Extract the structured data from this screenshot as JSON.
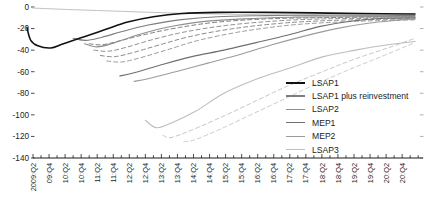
{
  "chart_data": {
    "type": "line",
    "title": "",
    "xlabel": "",
    "ylabel": "",
    "x_axis": {
      "start_label": "2009:Q2",
      "end_label": "20:Q4",
      "tick_unit": "quarter",
      "label_rotation_deg": -90,
      "tick_labels": [
        "2009:Q2",
        "09:Q4",
        "10:Q2",
        "10:Q4",
        "11:Q2",
        "11:Q4",
        "12:Q2",
        "12:Q4",
        "13:Q2",
        "13:Q4",
        "14:Q2",
        "14:Q4",
        "15:Q2",
        "15:Q4",
        "16:Q2",
        "16:Q4",
        "17:Q2",
        "17:Q4",
        "18:Q2",
        "18:Q4",
        "19:Q2",
        "19:Q4",
        "20:Q2",
        "20:Q4"
      ]
    },
    "y_axis": {
      "ticks": [
        0,
        -20,
        -40,
        -60,
        -80,
        -100,
        -120,
        -140
      ],
      "tick_labels": [
        "0",
        "-20",
        "-40",
        "-60",
        "-80",
        "-100",
        "-120",
        "-140"
      ],
      "range": [
        -140,
        0
      ],
      "right_edge_ticks": true
    },
    "grid": "off",
    "legend_position": "inside-right",
    "series": [
      {
        "name": "LSAP1",
        "color": "#111111",
        "width": 1.6,
        "dash": null,
        "in_legend": true,
        "points": [
          [
            2009.06,
            -19
          ],
          [
            2009.18,
            -31
          ],
          [
            2009.4,
            -36
          ],
          [
            2009.8,
            -38
          ],
          [
            2010.2,
            -34
          ],
          [
            2010.8,
            -28
          ],
          [
            2011.5,
            -21
          ],
          [
            2012.2,
            -14
          ],
          [
            2013.0,
            -9
          ],
          [
            2013.9,
            -6
          ],
          [
            2015.0,
            -5
          ],
          [
            2016.5,
            -5
          ],
          [
            2018.0,
            -5.5
          ],
          [
            2019.5,
            -6
          ],
          [
            2021.15,
            -6.5
          ]
        ]
      },
      {
        "name": "LSAP1 plus reinvestment",
        "color": "#7d7d7d",
        "width": 1.1,
        "dash": null,
        "in_legend": true,
        "points": [
          [
            2010.5,
            -29
          ],
          [
            2010.9,
            -31
          ],
          [
            2011.4,
            -28
          ],
          [
            2012.0,
            -23
          ],
          [
            2012.8,
            -17
          ],
          [
            2013.8,
            -12
          ],
          [
            2015.0,
            -9
          ],
          [
            2016.5,
            -8
          ],
          [
            2018.0,
            -7.5
          ],
          [
            2019.5,
            -7.5
          ],
          [
            2021.15,
            -8
          ]
        ]
      },
      {
        "name": "LSAP2",
        "color": "#8f8f8f",
        "width": 1.1,
        "dash": null,
        "in_legend": true,
        "points": [
          [
            2010.85,
            -34
          ],
          [
            2011.25,
            -37
          ],
          [
            2011.8,
            -33
          ],
          [
            2012.5,
            -26
          ],
          [
            2013.4,
            -19
          ],
          [
            2014.4,
            -14
          ],
          [
            2015.8,
            -11
          ],
          [
            2017.3,
            -9.5
          ],
          [
            2019.0,
            -9
          ],
          [
            2021.15,
            -9
          ]
        ]
      },
      {
        "name": "MEP1",
        "color": "#6f6f6f",
        "width": 1.1,
        "dash": null,
        "in_legend": true,
        "points": [
          [
            2011.95,
            -64
          ],
          [
            2012.4,
            -61
          ],
          [
            2013.2,
            -54
          ],
          [
            2014.2,
            -46
          ],
          [
            2015.2,
            -40
          ],
          [
            2016.2,
            -33
          ],
          [
            2017.2,
            -26
          ],
          [
            2018.2,
            -18
          ],
          [
            2019.2,
            -13
          ],
          [
            2020.2,
            -10.5
          ],
          [
            2021.15,
            -10
          ]
        ]
      },
      {
        "name": "MEP2",
        "color": "#9b9b9b",
        "width": 1.1,
        "dash": null,
        "in_legend": true,
        "points": [
          [
            2012.4,
            -69
          ],
          [
            2012.9,
            -66
          ],
          [
            2013.7,
            -60
          ],
          [
            2014.7,
            -52
          ],
          [
            2015.7,
            -44
          ],
          [
            2016.7,
            -35
          ],
          [
            2017.7,
            -27
          ],
          [
            2018.7,
            -20
          ],
          [
            2019.7,
            -15
          ],
          [
            2020.7,
            -12
          ],
          [
            2021.15,
            -11
          ]
        ]
      },
      {
        "name": "LSAP3",
        "color": "#bdbdbd",
        "width": 1.1,
        "dash": null,
        "in_legend": true,
        "points": [
          [
            2012.75,
            -105
          ],
          [
            2013.1,
            -112
          ],
          [
            2013.6,
            -107
          ],
          [
            2014.3,
            -97
          ],
          [
            2015.2,
            -80
          ],
          [
            2016.2,
            -67
          ],
          [
            2017.2,
            -57
          ],
          [
            2018.3,
            -46
          ],
          [
            2019.3,
            -40
          ],
          [
            2020.3,
            -35
          ],
          [
            2021.15,
            -32
          ]
        ]
      },
      {
        "name": "LSAP1 plus reinvestment (dashed variant)",
        "color": "#7d7d7d",
        "width": 1,
        "dash": "4,3",
        "in_legend": false,
        "points": [
          [
            2011.0,
            -34
          ],
          [
            2011.4,
            -35
          ],
          [
            2012.0,
            -31
          ],
          [
            2012.8,
            -25
          ],
          [
            2013.8,
            -19
          ],
          [
            2015.0,
            -14
          ],
          [
            2016.5,
            -11
          ],
          [
            2018.0,
            -10
          ],
          [
            2019.5,
            -9.5
          ],
          [
            2021.15,
            -9
          ]
        ]
      },
      {
        "name": "LSAP2 (dashed variant)",
        "color": "#8f8f8f",
        "width": 1,
        "dash": "4,3",
        "in_legend": false,
        "points": [
          [
            2011.15,
            -40
          ],
          [
            2011.6,
            -41
          ],
          [
            2012.2,
            -37
          ],
          [
            2013.0,
            -30
          ],
          [
            2014.0,
            -23
          ],
          [
            2015.3,
            -17
          ],
          [
            2016.8,
            -13
          ],
          [
            2018.3,
            -11
          ],
          [
            2019.8,
            -10.5
          ],
          [
            2021.15,
            -10
          ]
        ]
      },
      {
        "name": "MEP1 (dashed variant)",
        "color": "#8a8a8a",
        "width": 1,
        "dash": "4,3",
        "in_legend": false,
        "points": [
          [
            2011.35,
            -45
          ],
          [
            2011.8,
            -46
          ],
          [
            2012.4,
            -42
          ],
          [
            2013.2,
            -35
          ],
          [
            2014.2,
            -27
          ],
          [
            2015.5,
            -20
          ],
          [
            2017.0,
            -15
          ],
          [
            2018.5,
            -12.5
          ],
          [
            2020.0,
            -11.5
          ],
          [
            2021.15,
            -11
          ]
        ]
      },
      {
        "name": "MEP2 (dashed variant)",
        "color": "#9b9b9b",
        "width": 1,
        "dash": "4,3",
        "in_legend": false,
        "points": [
          [
            2011.55,
            -50
          ],
          [
            2012.0,
            -51
          ],
          [
            2012.6,
            -47
          ],
          [
            2013.4,
            -40
          ],
          [
            2014.4,
            -31
          ],
          [
            2015.7,
            -23
          ],
          [
            2017.2,
            -17
          ],
          [
            2018.7,
            -14
          ],
          [
            2020.2,
            -12.5
          ],
          [
            2021.15,
            -12
          ]
        ]
      },
      {
        "name": "LSAP3 (dashed variant 1)",
        "color": "#c6c6c6",
        "width": 1,
        "dash": "4,3",
        "in_legend": false,
        "points": [
          [
            2013.3,
            -119
          ],
          [
            2013.55,
            -121
          ],
          [
            2014.2,
            -114
          ],
          [
            2015.2,
            -101
          ],
          [
            2016.2,
            -87
          ],
          [
            2017.2,
            -73
          ],
          [
            2018.35,
            -59
          ],
          [
            2019.3,
            -48
          ],
          [
            2020.3,
            -38
          ],
          [
            2021.15,
            -29
          ]
        ]
      },
      {
        "name": "LSAP3 (dashed variant 2)",
        "color": "#cccccc",
        "width": 1,
        "dash": "4,3",
        "in_legend": false,
        "points": [
          [
            2013.95,
            -125
          ],
          [
            2014.3,
            -123
          ],
          [
            2015.1,
            -113
          ],
          [
            2016.1,
            -99
          ],
          [
            2017.1,
            -85
          ],
          [
            2018.1,
            -71
          ],
          [
            2019.1,
            -58
          ],
          [
            2020.1,
            -46
          ],
          [
            2021.15,
            -33
          ]
        ]
      },
      {
        "name": "unlabeled upper light line",
        "color": "#c2c2c2",
        "width": 1,
        "dash": null,
        "in_legend": false,
        "points": [
          [
            2009.25,
            -1
          ],
          [
            2010.5,
            -2.5
          ],
          [
            2012.0,
            -4
          ],
          [
            2013.5,
            -5.5
          ],
          [
            2015.0,
            -6.5
          ],
          [
            2016.5,
            -7.2
          ],
          [
            2018.0,
            -7.8
          ],
          [
            2019.5,
            -8.3
          ],
          [
            2021.15,
            -8.8
          ]
        ]
      }
    ]
  }
}
